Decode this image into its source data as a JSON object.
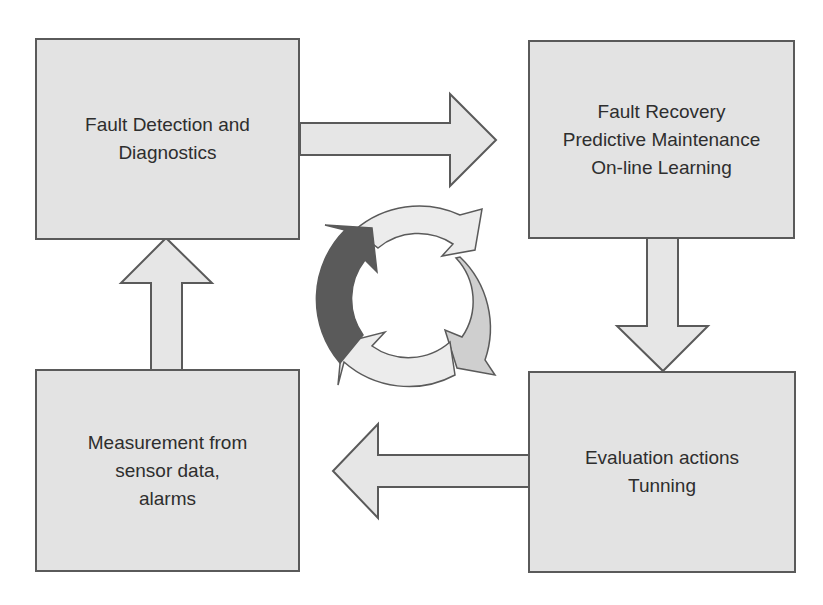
{
  "diagram": {
    "boxes": [
      {
        "id": "fault-detection",
        "lines": [
          "Fault Detection and",
          "Diagnostics"
        ]
      },
      {
        "id": "fault-recovery",
        "lines": [
          "Fault Recovery",
          "Predictive Maintenance",
          "On-line Learning"
        ]
      },
      {
        "id": "evaluation",
        "lines": [
          "Evaluation actions",
          "Tunning"
        ]
      },
      {
        "id": "measurement",
        "lines": [
          "Measurement from",
          "sensor data,",
          "alarms"
        ]
      }
    ],
    "arrows": [
      {
        "from": "fault-detection",
        "to": "fault-recovery",
        "direction": "right"
      },
      {
        "from": "fault-recovery",
        "to": "evaluation",
        "direction": "down"
      },
      {
        "from": "evaluation",
        "to": "measurement",
        "direction": "left"
      },
      {
        "from": "measurement",
        "to": "fault-detection",
        "direction": "up"
      }
    ],
    "cycle_icon": {
      "segments": 4,
      "highlighted_segment": "left",
      "colors": {
        "dark": "#5a5a5a",
        "medium": "#cfcfcf",
        "light": "#ececec"
      }
    },
    "colors": {
      "box_fill": "#e3e3e3",
      "border": "#5a5a5a",
      "text": "#2e2e2e",
      "arrow_fill": "#e6e6e6"
    }
  }
}
